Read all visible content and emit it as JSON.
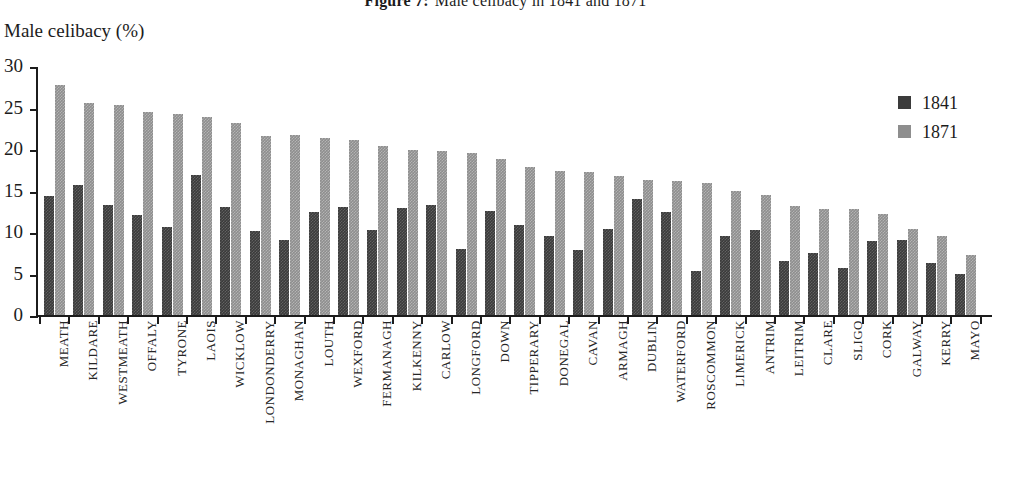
{
  "title": {
    "label": "Figure 7:",
    "text": "Male celibacy in 1841 and 1871"
  },
  "axis_title": "Male celibacy (%)",
  "legend": {
    "position": "top-right",
    "entries": [
      {
        "name": "1841",
        "label": "1841",
        "color": "#3b3b3b"
      },
      {
        "name": "1871",
        "label": "1871",
        "color": "#8e8e8e"
      }
    ]
  },
  "chart_data": {
    "type": "bar",
    "xlabel": "",
    "ylabel": "Male celibacy (%)",
    "ylim": [
      0,
      30
    ],
    "yticks": [
      0,
      5,
      10,
      15,
      20,
      25,
      30
    ],
    "ytick_labels": [
      "0",
      "5",
      "10",
      "15",
      "20",
      "25",
      "30"
    ],
    "grid": false,
    "legend_position": "top-right",
    "categories": [
      "MEATH",
      "KILDARE",
      "WESTMEATH",
      "OFFALY",
      "TYRONE",
      "LAOIS",
      "WICKLOW",
      "LONDONDERRY",
      "MONAGHAN",
      "LOUTH",
      "WEXFORD",
      "FERMANAGH",
      "KILKENNY",
      "CARLOW",
      "LONGFORD",
      "DOWN",
      "TIPPERARY",
      "DONEGAL",
      "CAVAN",
      "ARMAGH",
      "DUBLIN",
      "WATERFORD",
      "ROSCOMMON",
      "LIMERICK",
      "ANTRIM",
      "LEITRIM",
      "CLARE",
      "SLIGO",
      "CORK",
      "GALWAY",
      "KERRY",
      "MAYO"
    ],
    "series": [
      {
        "name": "1841",
        "color": "#3b3b3b",
        "values": [
          14.3,
          15.7,
          13.3,
          12.1,
          10.6,
          16.9,
          13.0,
          10.1,
          9.0,
          12.4,
          13.0,
          10.2,
          12.9,
          13.2,
          8.0,
          12.5,
          10.9,
          9.5,
          7.8,
          10.4,
          14.0,
          12.4,
          5.3,
          9.5,
          10.3,
          6.5,
          7.5,
          5.7,
          8.9,
          9.0,
          6.3,
          5.0
        ]
      },
      {
        "name": "1871",
        "color": "#8e8e8e",
        "values": [
          27.7,
          25.6,
          25.3,
          24.4,
          24.2,
          23.8,
          23.1,
          21.6,
          21.7,
          21.3,
          21.1,
          20.4,
          19.9,
          19.8,
          19.5,
          18.8,
          17.8,
          17.4,
          17.2,
          16.8,
          16.3,
          16.1,
          15.9,
          14.9,
          14.4,
          13.1,
          12.8,
          12.8,
          12.2,
          10.4,
          9.5,
          7.2
        ]
      }
    ]
  }
}
